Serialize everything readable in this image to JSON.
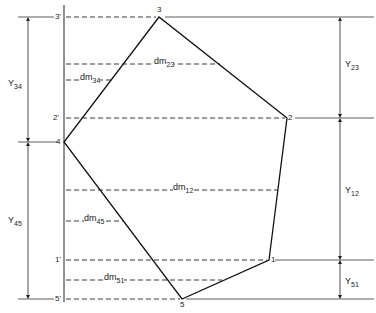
{
  "diagram": {
    "type": "polygon-dimension-drawing",
    "vertices": [
      {
        "id": "1",
        "label": "1",
        "x": 269,
        "y": 260
      },
      {
        "id": "2",
        "label": "2",
        "x": 287,
        "y": 118
      },
      {
        "id": "3",
        "label": "3",
        "x": 159,
        "y": 17
      },
      {
        "id": "4",
        "label": "4",
        "x": 64,
        "y": 142
      },
      {
        "id": "5",
        "label": "5",
        "x": 182,
        "y": 299
      }
    ],
    "projections": [
      {
        "label": "3'",
        "y": 17
      },
      {
        "label": "2'",
        "y": 118
      },
      {
        "label": "1'",
        "y": 260
      },
      {
        "label": "5'",
        "y": 299
      }
    ],
    "midlines": [
      {
        "name": "dm23",
        "base": "dm",
        "sub": "23",
        "y": 64
      },
      {
        "name": "dm34",
        "base": "dm",
        "sub": "34",
        "y": 80
      },
      {
        "name": "dm12",
        "base": "dm",
        "sub": "12",
        "y": 190
      },
      {
        "name": "dm45",
        "base": "dm",
        "sub": "45",
        "y": 221
      },
      {
        "name": "dm51",
        "base": "dm",
        "sub": "51",
        "y": 280
      }
    ],
    "dimensions_left": [
      {
        "base": "Y",
        "sub": "34",
        "from_y": 17,
        "to_y": 142
      },
      {
        "base": "Y",
        "sub": "45",
        "from_y": 142,
        "to_y": 299
      }
    ],
    "dimensions_right": [
      {
        "base": "Y",
        "sub": "23",
        "from_y": 17,
        "to_y": 118
      },
      {
        "base": "Y",
        "sub": "12",
        "from_y": 118,
        "to_y": 260
      },
      {
        "base": "Y",
        "sub": "51",
        "from_y": 260,
        "to_y": 299
      }
    ]
  },
  "labels": {
    "p1": "1",
    "p2": "2",
    "p3": "3",
    "p4": "4",
    "p5": "5",
    "p1p": "1'",
    "p2p": "2'",
    "p3p": "3'",
    "p5p": "5'",
    "dm": "dm",
    "Y": "Y",
    "s23": "23",
    "s34": "34",
    "s12": "12",
    "s45": "45",
    "s51": "51"
  }
}
